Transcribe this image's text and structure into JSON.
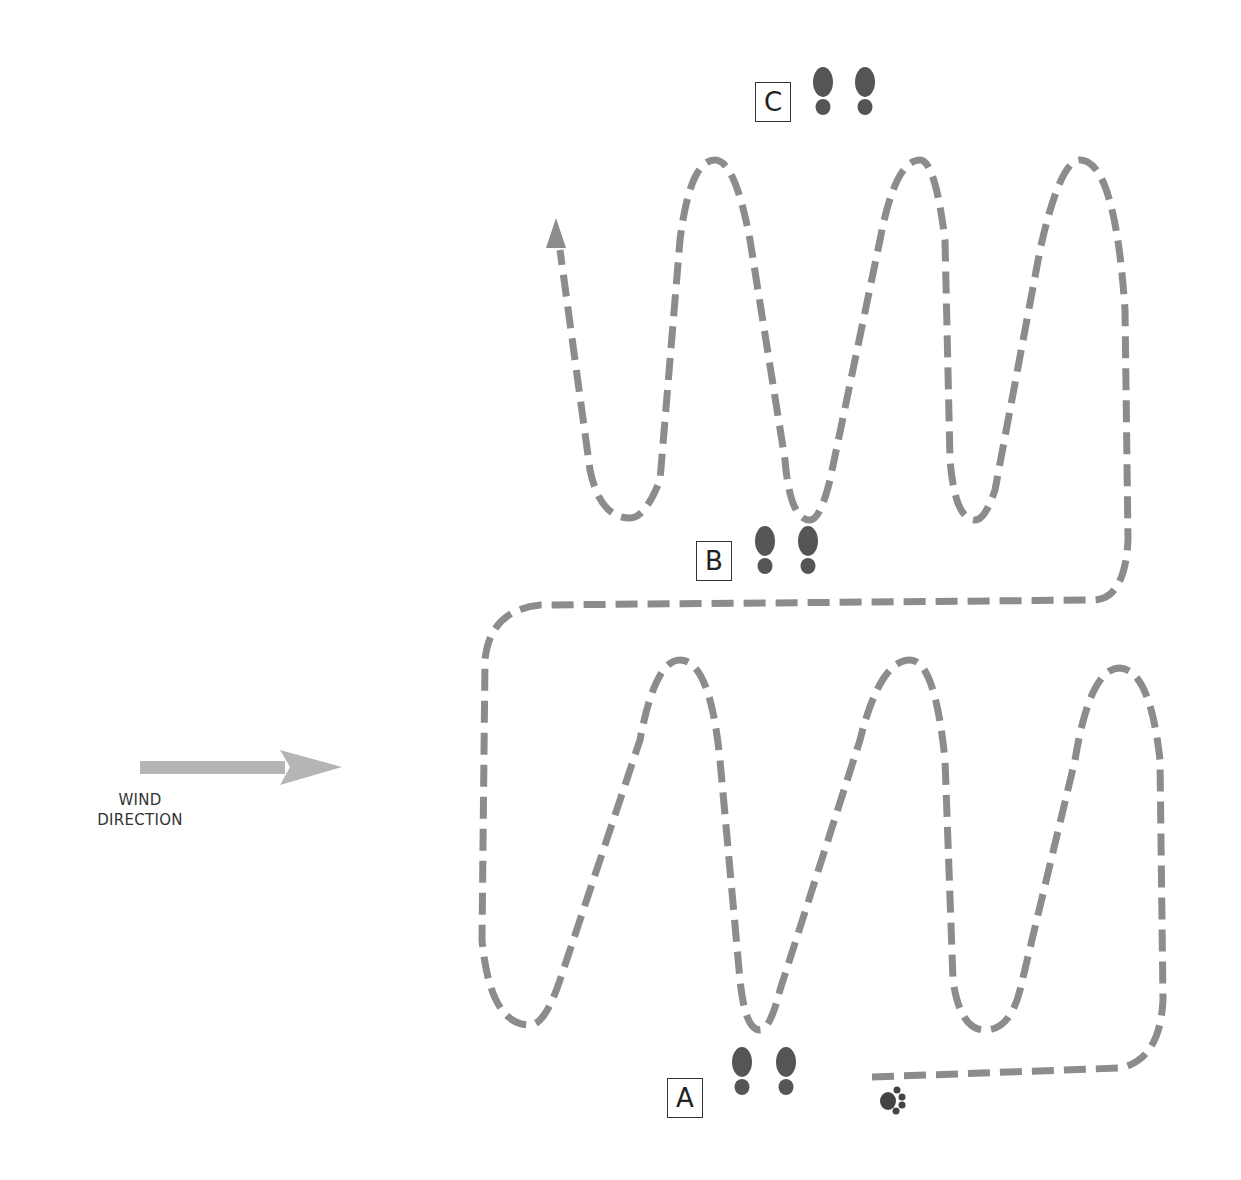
{
  "diagram": {
    "type": "search-pattern",
    "path_color": "#8c8c8c",
    "footprint_color": "#555555",
    "arrow_color": "#b3b3b3",
    "checkpoints": [
      {
        "id": "A",
        "label": "A"
      },
      {
        "id": "B",
        "label": "B"
      },
      {
        "id": "C",
        "label": "C"
      }
    ],
    "wind": {
      "label_line1": "WIND",
      "label_line2": "DIRECTION",
      "direction": "right"
    },
    "start_marker": "paw-print",
    "end_marker": "arrow-up"
  }
}
